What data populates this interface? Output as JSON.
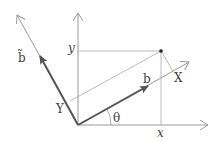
{
  "diagram": {
    "labels": {
      "x": "x",
      "y": "y",
      "X": "X",
      "Y": "Y",
      "b": "b",
      "b_tilde": "b̃",
      "theta": "θ"
    },
    "colors": {
      "axis": "#9a9a9a",
      "vector": "#555555",
      "text": "#444444"
    }
  }
}
